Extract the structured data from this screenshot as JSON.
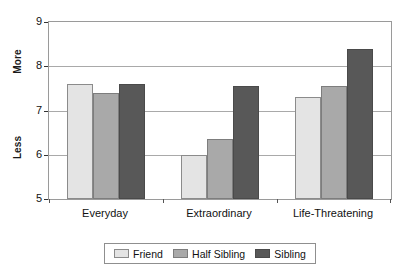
{
  "chart_data": {
    "type": "bar",
    "title": "",
    "subtitle": "",
    "xlabel": "",
    "ylabel": "",
    "categories": [
      "Everyday",
      "Extraordinary",
      "Life-Threatening"
    ],
    "series": [
      {
        "name": "Friend",
        "color": "#e4e4e4",
        "values": [
          7.6,
          6.0,
          7.3
        ]
      },
      {
        "name": "Half Sibling",
        "color": "#a9a9a9",
        "values": [
          7.4,
          6.35,
          7.55
        ]
      },
      {
        "name": "Sibling",
        "color": "#585858",
        "values": [
          7.6,
          7.55,
          8.4
        ]
      }
    ],
    "ylim": [
      5,
      9
    ],
    "yticks": [
      5,
      6,
      7,
      8,
      9
    ],
    "ytick_labels": [
      "5",
      "6",
      "7",
      "8",
      "9"
    ],
    "y_axis_anchor_labels": {
      "high": "More",
      "low": "Less"
    },
    "grid": true,
    "grid_axis": "y",
    "legend_position": "bottom",
    "legend_entries": [
      "Friend",
      "Half Sibling",
      "Sibling"
    ]
  },
  "axis": {
    "more_label": "More",
    "less_label": "Less"
  },
  "colors": {
    "friend": "#e4e4e4",
    "half_sibling": "#a9a9a9",
    "sibling": "#585858",
    "grid": "#a9a9a9",
    "border": "#9a9a9a",
    "text": "#111111"
  }
}
